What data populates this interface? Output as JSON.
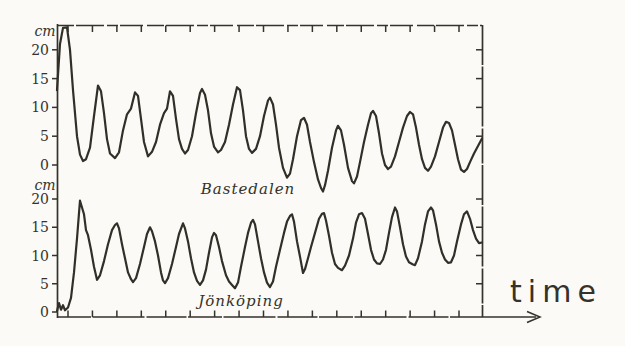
{
  "figure": {
    "background": "#fbfaf6",
    "ink_color": "#35322b",
    "description_labels": {
      "top_unit": "cm",
      "bottom_unit": "cm",
      "x_axis": "time"
    }
  },
  "chart_data": [
    {
      "type": "line",
      "title": "Bastedalen",
      "ylabel": "cm",
      "xlabel": "time",
      "yticks": [
        0,
        5,
        10,
        15,
        20
      ],
      "ylim": [
        -5,
        25
      ],
      "grid": false,
      "legend_position": "inline-label-below-curve",
      "x_tick_count": 17,
      "x_is_pixel_offset": true,
      "points_t_px_cm": [
        [
          0,
          13
        ],
        [
          3,
          21
        ],
        [
          6,
          23.8
        ],
        [
          10,
          23.9
        ],
        [
          13,
          20
        ],
        [
          16,
          13
        ],
        [
          20,
          5
        ],
        [
          23,
          1.8
        ],
        [
          26,
          0.7
        ],
        [
          29,
          1
        ],
        [
          33,
          3
        ],
        [
          37,
          8.5
        ],
        [
          41,
          13.8
        ],
        [
          44,
          12.8
        ],
        [
          47,
          9
        ],
        [
          50,
          4.5
        ],
        [
          53,
          2
        ],
        [
          58,
          1.2
        ],
        [
          62,
          2.2
        ],
        [
          66,
          6
        ],
        [
          70,
          8.8
        ],
        [
          74,
          9.8
        ],
        [
          78,
          12.6
        ],
        [
          81,
          12
        ],
        [
          84,
          8
        ],
        [
          87,
          4
        ],
        [
          91,
          1.5
        ],
        [
          95,
          2.3
        ],
        [
          99,
          4
        ],
        [
          103,
          7
        ],
        [
          107,
          9
        ],
        [
          110,
          9.8
        ],
        [
          113,
          12.8
        ],
        [
          116,
          12
        ],
        [
          119,
          8
        ],
        [
          122,
          4.5
        ],
        [
          125,
          2.8
        ],
        [
          128,
          2
        ],
        [
          131,
          2.6
        ],
        [
          135,
          5
        ],
        [
          139,
          9
        ],
        [
          143,
          12.5
        ],
        [
          145,
          13.2
        ],
        [
          148,
          12.2
        ],
        [
          151,
          9.5
        ],
        [
          154,
          5.5
        ],
        [
          157,
          3.2
        ],
        [
          161,
          2.2
        ],
        [
          164,
          2.6
        ],
        [
          168,
          4
        ],
        [
          172,
          7
        ],
        [
          176,
          10.5
        ],
        [
          180,
          13.5
        ],
        [
          183,
          13
        ],
        [
          186,
          9.5
        ],
        [
          189,
          5
        ],
        [
          192,
          2.8
        ],
        [
          195,
          2.1
        ],
        [
          199,
          2.8
        ],
        [
          203,
          5
        ],
        [
          207,
          8.5
        ],
        [
          211,
          11.2
        ],
        [
          213,
          11.7
        ],
        [
          216,
          10.5
        ],
        [
          219,
          7
        ],
        [
          222,
          3
        ],
        [
          226,
          -0.5
        ],
        [
          230,
          -2.2
        ],
        [
          233,
          -1.5
        ],
        [
          236,
          1
        ],
        [
          240,
          5
        ],
        [
          244,
          7.8
        ],
        [
          247,
          8.2
        ],
        [
          250,
          7
        ],
        [
          253,
          4
        ],
        [
          257,
          0.5
        ],
        [
          261,
          -2.5
        ],
        [
          264,
          -4
        ],
        [
          266,
          -4.6
        ],
        [
          268,
          -3.5
        ],
        [
          271,
          -1
        ],
        [
          275,
          3
        ],
        [
          279,
          6
        ],
        [
          281,
          6.8
        ],
        [
          284,
          6
        ],
        [
          287,
          3.5
        ],
        [
          291,
          -0.5
        ],
        [
          295,
          -2.8
        ],
        [
          297,
          -3.2
        ],
        [
          300,
          -2
        ],
        [
          303,
          0.5
        ],
        [
          307,
          4
        ],
        [
          311,
          7
        ],
        [
          314,
          9
        ],
        [
          316,
          9.4
        ],
        [
          319,
          8.5
        ],
        [
          322,
          5.5
        ],
        [
          325,
          2
        ],
        [
          328,
          0
        ],
        [
          331,
          -0.7
        ],
        [
          334,
          -0.3
        ],
        [
          338,
          1.5
        ],
        [
          342,
          4
        ],
        [
          346,
          6.5
        ],
        [
          350,
          8.5
        ],
        [
          353,
          9.2
        ],
        [
          356,
          8.8
        ],
        [
          359,
          6.5
        ],
        [
          362,
          3.5
        ],
        [
          365,
          1
        ],
        [
          368,
          -0.5
        ],
        [
          371,
          -1
        ],
        [
          374,
          -0.3
        ],
        [
          378,
          1.5
        ],
        [
          382,
          4
        ],
        [
          386,
          6.5
        ],
        [
          389,
          7.5
        ],
        [
          392,
          7.3
        ],
        [
          395,
          6
        ],
        [
          398,
          3.5
        ],
        [
          401,
          1
        ],
        [
          404,
          -0.8
        ],
        [
          407,
          -1.2
        ],
        [
          410,
          -0.7
        ],
        [
          413,
          0.5
        ],
        [
          417,
          2
        ],
        [
          421,
          3.3
        ],
        [
          425,
          4.6
        ]
      ]
    },
    {
      "type": "line",
      "title": "Jönköping",
      "ylabel": "cm",
      "xlabel": "time",
      "yticks": [
        0,
        5,
        10,
        15,
        20
      ],
      "ylim": [
        0,
        21
      ],
      "grid": false,
      "legend_position": "inline-label-below-curve",
      "x_tick_count": 17,
      "x_is_pixel_offset": true,
      "points_t_px_cm": [
        [
          0,
          0.2
        ],
        [
          2,
          1.6
        ],
        [
          4,
          0.4
        ],
        [
          6,
          1.2
        ],
        [
          8,
          0.3
        ],
        [
          11,
          0.8
        ],
        [
          14,
          2.5
        ],
        [
          17,
          7
        ],
        [
          20,
          13
        ],
        [
          22,
          17.5
        ],
        [
          23,
          19.7
        ],
        [
          25,
          18.5
        ],
        [
          27,
          17.3
        ],
        [
          29,
          14.5
        ],
        [
          31,
          13.6
        ],
        [
          34,
          11
        ],
        [
          37,
          8
        ],
        [
          40,
          5.7
        ],
        [
          43,
          6.5
        ],
        [
          47,
          9
        ],
        [
          51,
          12
        ],
        [
          55,
          14.5
        ],
        [
          58,
          15.4
        ],
        [
          60,
          15.7
        ],
        [
          62,
          14.8
        ],
        [
          65,
          12
        ],
        [
          68,
          9.5
        ],
        [
          71,
          7
        ],
        [
          74,
          5.8
        ],
        [
          76,
          5.3
        ],
        [
          79,
          6
        ],
        [
          83,
          8.5
        ],
        [
          87,
          11.5
        ],
        [
          90,
          13.8
        ],
        [
          93,
          15
        ],
        [
          95,
          14.3
        ],
        [
          98,
          12.5
        ],
        [
          101,
          10
        ],
        [
          104,
          7
        ],
        [
          106,
          5.6
        ],
        [
          108,
          5.1
        ],
        [
          111,
          6
        ],
        [
          115,
          8.5
        ],
        [
          119,
          11.5
        ],
        [
          122,
          13.8
        ],
        [
          126,
          15.7
        ],
        [
          128,
          14.8
        ],
        [
          131,
          12.5
        ],
        [
          134,
          9.5
        ],
        [
          137,
          7
        ],
        [
          140,
          5.5
        ],
        [
          143,
          4.8
        ],
        [
          146,
          5.6
        ],
        [
          149,
          7.5
        ],
        [
          152,
          10.5
        ],
        [
          155,
          13.2
        ],
        [
          157,
          14
        ],
        [
          159,
          13.6
        ],
        [
          162,
          11.5
        ],
        [
          165,
          9
        ],
        [
          169,
          6.5
        ],
        [
          172,
          5.4
        ],
        [
          175,
          4.8
        ],
        [
          178,
          4.2
        ],
        [
          181,
          5.2
        ],
        [
          184,
          8
        ],
        [
          188,
          11.5
        ],
        [
          191,
          14
        ],
        [
          194,
          15.8
        ],
        [
          196,
          16.3
        ],
        [
          198,
          15.5
        ],
        [
          201,
          12.5
        ],
        [
          204,
          9.5
        ],
        [
          207,
          7
        ],
        [
          210,
          5.2
        ],
        [
          213,
          4.4
        ],
        [
          216,
          5.4
        ],
        [
          219,
          8
        ],
        [
          223,
          11
        ],
        [
          227,
          14
        ],
        [
          230,
          16
        ],
        [
          233,
          17
        ],
        [
          235,
          17.3
        ],
        [
          237,
          16
        ],
        [
          240,
          12.5
        ],
        [
          243,
          9.8
        ],
        [
          246,
          6.9
        ],
        [
          248,
          7.6
        ],
        [
          251,
          9.5
        ],
        [
          254,
          11.5
        ],
        [
          258,
          14
        ],
        [
          262,
          16.5
        ],
        [
          265,
          17.4
        ],
        [
          267,
          17.5
        ],
        [
          269,
          16.2
        ],
        [
          272,
          13.5
        ],
        [
          275,
          10.5
        ],
        [
          278,
          8.5
        ],
        [
          281,
          7.8
        ],
        [
          285,
          7.4
        ],
        [
          288,
          8.2
        ],
        [
          292,
          10
        ],
        [
          296,
          13
        ],
        [
          299,
          15.8
        ],
        [
          302,
          17.3
        ],
        [
          305,
          17.5
        ],
        [
          308,
          16.5
        ],
        [
          311,
          13.8
        ],
        [
          314,
          11
        ],
        [
          317,
          9.3
        ],
        [
          320,
          8.6
        ],
        [
          323,
          8.5
        ],
        [
          326,
          9.3
        ],
        [
          329,
          11
        ],
        [
          332,
          14
        ],
        [
          335,
          16.8
        ],
        [
          338,
          18.5
        ],
        [
          340,
          17.8
        ],
        [
          343,
          15
        ],
        [
          346,
          12
        ],
        [
          349,
          9.8
        ],
        [
          352,
          8.8
        ],
        [
          356,
          8.4
        ],
        [
          358,
          8.3
        ],
        [
          361,
          9.5
        ],
        [
          365,
          12.5
        ],
        [
          368,
          15.5
        ],
        [
          371,
          17.8
        ],
        [
          374,
          18.5
        ],
        [
          376,
          18
        ],
        [
          379,
          15.5
        ],
        [
          382,
          12.5
        ],
        [
          385,
          10.5
        ],
        [
          388,
          9.3
        ],
        [
          391,
          8.7
        ],
        [
          394,
          8.8
        ],
        [
          397,
          10
        ],
        [
          400,
          12.5
        ],
        [
          404,
          15.5
        ],
        [
          407,
          17.3
        ],
        [
          410,
          17.8
        ],
        [
          413,
          16.5
        ],
        [
          416,
          14.5
        ],
        [
          419,
          13
        ],
        [
          422,
          12.2
        ],
        [
          425,
          12.3
        ]
      ]
    }
  ]
}
